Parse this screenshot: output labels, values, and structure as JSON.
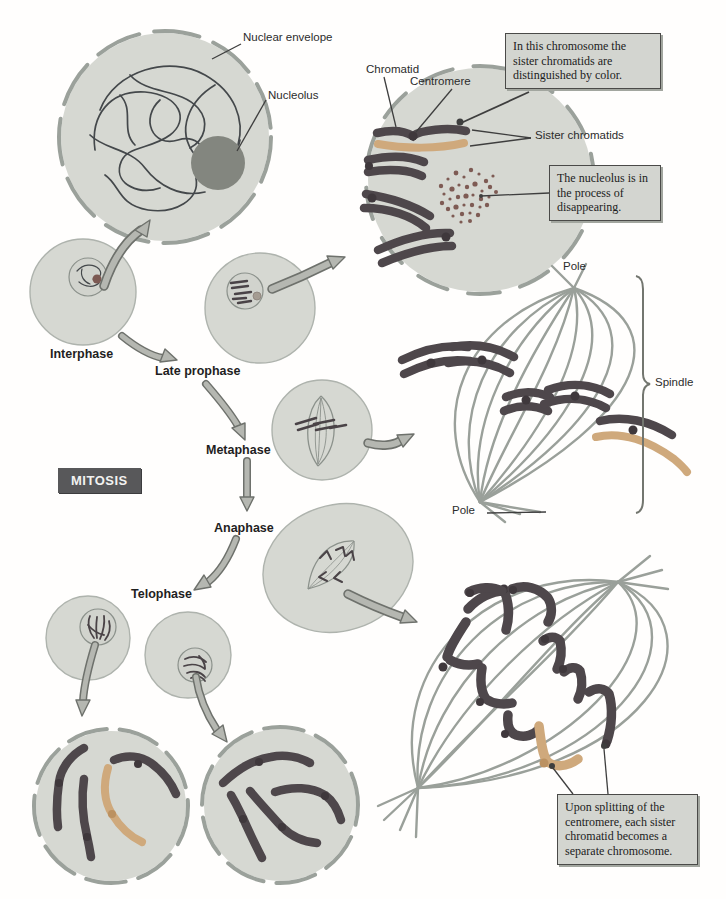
{
  "figure": {
    "subject": "Mitosis",
    "kind": "textbook cell-division diagram"
  },
  "labels": {
    "nuclear_envelope": "Nuclear envelope",
    "nucleolus": "Nucleolus",
    "chromatid": "Chromatid",
    "centromere": "Centromere",
    "sister_chromatids": "Sister chromatids",
    "pole_top": "Pole",
    "pole_bottom": "Pole",
    "spindle": "Spindle",
    "mitosis": "MITOSIS"
  },
  "phases": {
    "interphase": "Interphase",
    "late_prophase": "Late prophase",
    "metaphase": "Metaphase",
    "anaphase": "Anaphase",
    "telophase": "Telophase"
  },
  "callouts": {
    "sister_color": "In this chromosome the sister chromatids are distinguished by color.",
    "nucleolus_disappearing": "The nucleolus is in the process of disappearing.",
    "centromere_split": "Upon splitting of the centromere, each sister chromatid becomes a separate chromosome."
  },
  "colors": {
    "background": "#fffefd",
    "cell_fill": "#d6d8d2",
    "envelope": "#9ba19b",
    "chromosome_dark": "#4e474b",
    "chromatid_light": "#cfa97c",
    "nucleolus": "#83867f",
    "spindle_fiber": "#9aa09a",
    "arrow_fill": "#b5b7b1",
    "arrow_outline": "#6e716c",
    "callout_bg": "#d3d5d0",
    "mitosis_box": "#58585a"
  }
}
